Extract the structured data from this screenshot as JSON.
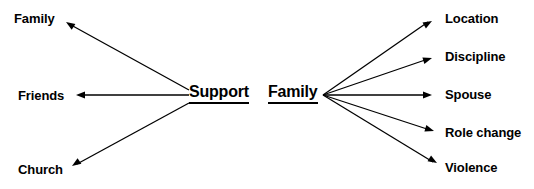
{
  "diagram": {
    "type": "node-link-diagram",
    "background_color": "#ffffff",
    "line_color": "#000000",
    "text_color": "#000000",
    "clusters": [
      {
        "id": "support-cluster",
        "hub": {
          "label": "Support",
          "underlined": true,
          "x": 189,
          "y": 95,
          "direction": "left"
        },
        "leaves": [
          {
            "label": "Family",
            "x": 14,
            "y": 19,
            "arrow_x": 66,
            "arrow_y": 22,
            "arrow_angle": -147
          },
          {
            "label": "Friends",
            "x": 18,
            "y": 96,
            "arrow_x": 76,
            "arrow_y": 95,
            "arrow_angle": 180
          },
          {
            "label": "Church",
            "x": 18,
            "y": 170,
            "arrow_x": 72,
            "arrow_y": 166,
            "arrow_angle": 146
          }
        ]
      },
      {
        "id": "family-cluster",
        "hub": {
          "label": "Family",
          "underlined": true,
          "x": 268,
          "y": 95,
          "direction": "right"
        },
        "leaves": [
          {
            "label": "Location",
            "x": 445,
            "y": 19,
            "arrow_x": 432,
            "arrow_y": 21,
            "arrow_angle": -30
          },
          {
            "label": "Discipline",
            "x": 445,
            "y": 57,
            "arrow_x": 432,
            "arrow_y": 58,
            "arrow_angle": -17
          },
          {
            "label": "Spouse",
            "x": 445,
            "y": 95,
            "arrow_x": 432,
            "arrow_y": 95,
            "arrow_angle": 0
          },
          {
            "label": "Role change",
            "x": 445,
            "y": 133,
            "arrow_x": 434,
            "arrow_y": 131,
            "arrow_angle": 17
          },
          {
            "label": "Violence",
            "x": 445,
            "y": 168,
            "arrow_x": 437,
            "arrow_y": 163,
            "arrow_angle": 31
          }
        ]
      }
    ],
    "edges": [
      {
        "id": "edge-support-family",
        "from": "Support",
        "to": "Family",
        "x1": 189,
        "y1": 90,
        "x2": 71,
        "y2": 25
      },
      {
        "id": "edge-support-friends",
        "from": "Support",
        "to": "Friends",
        "x1": 189,
        "y1": 95,
        "x2": 80,
        "y2": 95
      },
      {
        "id": "edge-support-church",
        "from": "Support",
        "to": "Church",
        "x1": 189,
        "y1": 103,
        "x2": 77,
        "y2": 164
      },
      {
        "id": "edge-family-location",
        "from": "Family",
        "to": "Location",
        "x1": 323,
        "y1": 95,
        "x2": 428,
        "y2": 22
      },
      {
        "id": "edge-family-discipline",
        "from": "Family",
        "to": "Discipline",
        "x1": 323,
        "y1": 95,
        "x2": 428,
        "y2": 59
      },
      {
        "id": "edge-family-spouse",
        "from": "Family",
        "to": "Spouse",
        "x1": 323,
        "y1": 95,
        "x2": 428,
        "y2": 95
      },
      {
        "id": "edge-family-rolechange",
        "from": "Family",
        "to": "Role change",
        "x1": 323,
        "y1": 95,
        "x2": 430,
        "y2": 130
      },
      {
        "id": "edge-family-violence",
        "from": "Family",
        "to": "Violence",
        "x1": 323,
        "y1": 95,
        "x2": 433,
        "y2": 162
      }
    ]
  }
}
